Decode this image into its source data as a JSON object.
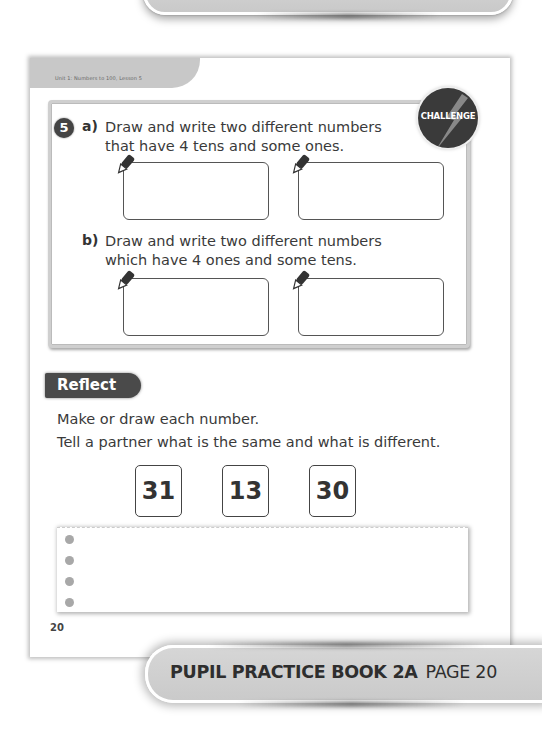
{
  "header": {
    "unit_label": "Unit 1: Numbers to 100, Lesson 5"
  },
  "challenge": {
    "badge_label": "CHALLENGE",
    "question_number": "5",
    "part_a": {
      "label": "a)",
      "line1": "Draw and write two different numbers",
      "line2": "that have 4 tens and some ones."
    },
    "part_b": {
      "label": "b)",
      "line1": "Draw and write two different numbers",
      "line2": "which have 4 ones and some tens."
    }
  },
  "reflect": {
    "title": "Reflect",
    "line1": "Make or draw each number.",
    "line2": "Tell a partner what is the same and what is different.",
    "numbers": [
      "31",
      "13",
      "30"
    ]
  },
  "page_number": "20",
  "footer": {
    "book": "PUPIL PRACTICE BOOK 2A",
    "page": "PAGE 20"
  },
  "colors": {
    "tab_gray": "#c8c8c8",
    "badge_dark": "#3a3a3a",
    "reflect_tab": "#4a4a4a",
    "dot_gray": "#a8a8a8"
  }
}
